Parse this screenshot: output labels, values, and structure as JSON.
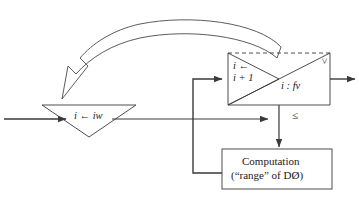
{
  "diagram": {
    "stroke_color": "#3a3a3a",
    "text_color": "#1a1a1a",
    "background": "#ffffff",
    "nodes": {
      "assign_triangle": {
        "shape": "down-triangle",
        "label": "i ← iw",
        "label_var": "i",
        "label_arrow": "←",
        "label_target": "iw"
      },
      "counter_triangle": {
        "shape": "right-triangle",
        "label_line1": "i ←",
        "label_line2": "i + 1"
      },
      "compare_triangle": {
        "shape": "right-triangle-lower",
        "label": "i  :  fv"
      },
      "computation_box": {
        "line1": "Computation",
        "line2": "(“range” of DØ)"
      }
    },
    "edge_labels": {
      "greater_than": ">",
      "less_equal": "≤"
    },
    "edges": [
      {
        "name": "input-arrow",
        "from": "left-edge",
        "to": "assign_triangle"
      },
      {
        "name": "assign-to-junction",
        "from": "assign_triangle",
        "to": "compare-junction"
      },
      {
        "name": "feedback-loop",
        "from": "computation_box",
        "to": "counter_triangle"
      },
      {
        "name": "compare-to-computation",
        "from": "compare_triangle",
        "to": "computation_box"
      },
      {
        "name": "exit-arrow",
        "from": "compare_triangle",
        "to": "right-edge"
      },
      {
        "name": "big-curved-arrow",
        "from": "box-top",
        "to": "assign_triangle"
      }
    ]
  }
}
